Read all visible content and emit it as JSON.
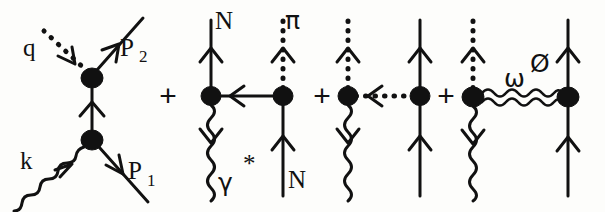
{
  "figure": {
    "background_color": "#fdfdfb",
    "ink_color": "#111111",
    "operators": [
      {
        "symbol": "+",
        "x": 168,
        "y": 98
      },
      {
        "symbol": "+",
        "x": 322,
        "y": 98
      },
      {
        "symbol": "+",
        "x": 446,
        "y": 98
      }
    ],
    "diagrams": [
      {
        "name": "born-s-channel",
        "labels": [
          {
            "name": "label-q",
            "text": "q",
            "x": 28,
            "y": 48
          },
          {
            "name": "label-P2",
            "text": "P",
            "sub": "2",
            "x": 128,
            "y": 50
          },
          {
            "name": "label-k",
            "text": "k",
            "x": 26,
            "y": 162
          },
          {
            "name": "label-P1",
            "text": "P",
            "sub": "1",
            "x": 137,
            "y": 173
          }
        ],
        "vertices": [
          {
            "name": "upper-vertex",
            "x": 92,
            "y": 78,
            "rx": 10,
            "ry": 9
          },
          {
            "name": "lower-vertex",
            "x": 92,
            "y": 140,
            "rx": 10,
            "ry": 9
          }
        ],
        "line_types": {
          "q": "dotted-outgoing-pion",
          "P2": "solid-outgoing-nucleon",
          "k": "wavy-incoming-photon",
          "P1": "solid-incoming-nucleon",
          "internal": "solid-nucleon-propagator"
        }
      },
      {
        "name": "pion-exchange-contact",
        "labels": [
          {
            "name": "label-N-top",
            "text": "N",
            "x": 222,
            "y": 22
          },
          {
            "name": "label-pi-top",
            "text": "π",
            "x": 290,
            "y": 20
          },
          {
            "name": "label-gamma",
            "text": "γ",
            "x": 226,
            "y": 182
          },
          {
            "name": "label-gamma-star",
            "text": "*",
            "x": 247,
            "y": 166
          },
          {
            "name": "label-N-bottom",
            "text": "N",
            "x": 294,
            "y": 181
          }
        ],
        "vertices": [
          {
            "name": "left-vertex",
            "x": 211,
            "y": 96,
            "rx": 9,
            "ry": 9
          },
          {
            "name": "right-vertex",
            "x": 283,
            "y": 96,
            "rx": 9,
            "ry": 9
          }
        ],
        "line_types": {
          "top_left": "solid-nucleon",
          "top_right": "dotted-pion",
          "bottom_left": "wavy-virtual-photon",
          "bottom_right": "solid-nucleon",
          "exchange": "solid-arrow-left"
        }
      },
      {
        "name": "pion-pole-exchange",
        "labels": [],
        "vertices": [
          {
            "name": "left-vertex",
            "x": 348,
            "y": 96,
            "rx": 9,
            "ry": 9
          },
          {
            "name": "right-vertex",
            "x": 420,
            "y": 96,
            "rx": 9,
            "ry": 9
          }
        ],
        "line_types": {
          "top_left": "dotted-pion",
          "top_right": "solid-nucleon",
          "bottom_left": "wavy-virtual-photon",
          "bottom_right": "solid-nucleon",
          "exchange": "dotted-arrow-left"
        }
      },
      {
        "name": "vector-meson-exchange",
        "labels": [
          {
            "name": "label-omega",
            "text": "ω",
            "x": 513,
            "y": 77
          },
          {
            "name": "label-phi",
            "text": "Ø",
            "x": 538,
            "y": 63
          }
        ],
        "vertices": [
          {
            "name": "left-vertex",
            "x": 473,
            "y": 97,
            "rx": 10,
            "ry": 9
          },
          {
            "name": "right-vertex",
            "x": 568,
            "y": 97,
            "rx": 10,
            "ry": 9
          }
        ],
        "line_types": {
          "top_left": "dotted-pion",
          "top_right": "solid-nucleon",
          "bottom_left": "wavy-virtual-photon",
          "bottom_right": "solid-nucleon",
          "exchange": "wavy-vector-meson"
        }
      }
    ]
  }
}
